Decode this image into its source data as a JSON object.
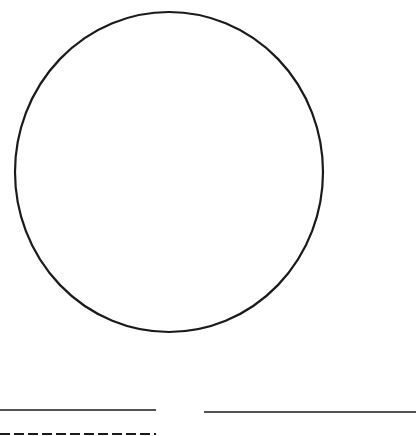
{
  "figure": {
    "background": "#ffffff",
    "stroke_color": "#1a1a1a",
    "circle": {
      "cx": 169,
      "cy": 172,
      "rx": 154,
      "ry": 160
    },
    "lines": [
      {
        "kind": "solid",
        "x1": 0,
        "x2": 156,
        "y": 410
      },
      {
        "kind": "solid",
        "x1": 204,
        "x2": 416,
        "y": 412
      },
      {
        "kind": "dashed",
        "x1": 0,
        "x2": 156,
        "y": 434
      }
    ]
  }
}
